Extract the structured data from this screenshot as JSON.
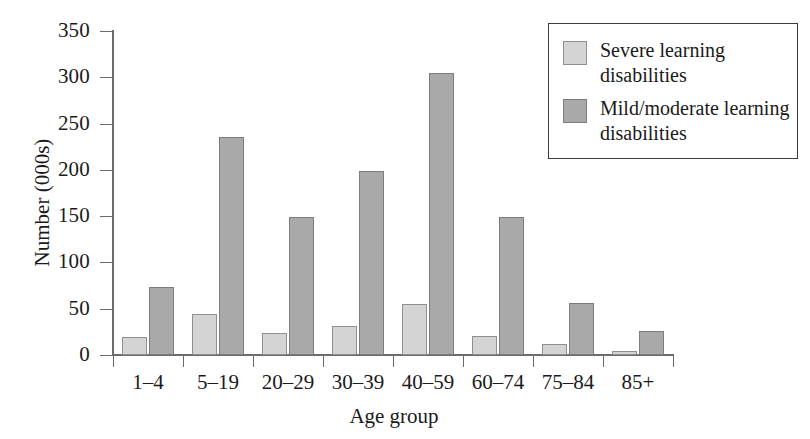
{
  "chart_data": {
    "type": "bar",
    "title": "",
    "xlabel": "Age group",
    "ylabel": "Number (000s)",
    "ylim": [
      0,
      350
    ],
    "ytick_step": 50,
    "yticks": [
      0,
      50,
      100,
      150,
      200,
      250,
      300,
      350
    ],
    "grid": false,
    "legend_position": "top-right",
    "categories": [
      "1–4",
      "5–19",
      "20–29",
      "30–39",
      "40–59",
      "60–74",
      "75–84",
      "85+"
    ],
    "series": [
      {
        "name": "Severe learning disabilities",
        "color": "#d4d4d4",
        "values": [
          20,
          44,
          24,
          31,
          55,
          21,
          12,
          4
        ]
      },
      {
        "name": "Mild/moderate learning disabilities",
        "color": "#a9a9a9",
        "values": [
          73,
          236,
          149,
          199,
          305,
          149,
          56,
          26
        ]
      }
    ]
  },
  "legend": {
    "entries": [
      {
        "label": "Severe learning disabilities",
        "swatch": "#d4d4d4"
      },
      {
        "label": "Mild/moderate learning disabilities",
        "swatch": "#a9a9a9"
      }
    ]
  },
  "axes": {
    "y_title": "Number (000s)",
    "x_title": "Age group"
  }
}
